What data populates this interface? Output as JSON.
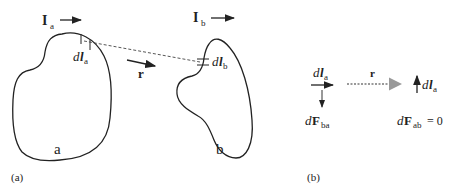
{
  "panel_a": {
    "caption": "(a)",
    "current_a": {
      "symbol": "I",
      "subscript": "a"
    },
    "current_b": {
      "symbol": "I",
      "subscript": "b"
    },
    "element_a": {
      "prefix": "d",
      "symbol": "l",
      "subscript": "a"
    },
    "element_b": {
      "prefix": "d",
      "symbol": "l",
      "subscript": "b"
    },
    "separation_vector": "r",
    "loop_a_label": "a",
    "loop_b_label": "b"
  },
  "panel_b": {
    "caption": "(b)",
    "element_a_left": {
      "prefix": "d",
      "symbol": "l",
      "subscript": "a"
    },
    "element_a_right": {
      "prefix": "d",
      "symbol": "l",
      "subscript": "a"
    },
    "separation_vector": "r",
    "force_ba": {
      "prefix": "d",
      "symbol": "F",
      "subscript": "ba"
    },
    "force_ab": {
      "prefix": "d",
      "symbol": "F",
      "subscript": "ab",
      "equals": "= 0"
    }
  }
}
